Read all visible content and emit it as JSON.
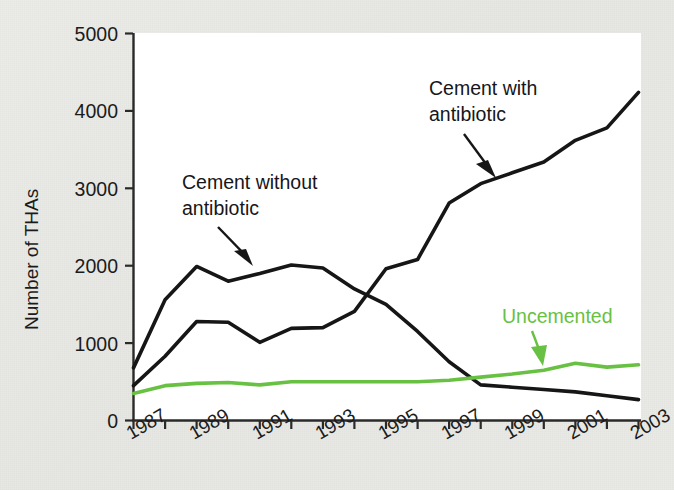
{
  "chart_data": {
    "type": "line",
    "title": "",
    "subtitle": "",
    "xlabel": "",
    "ylabel": "Number of THAs",
    "xlim": [
      1987,
      2003
    ],
    "ylim": [
      0,
      5000
    ],
    "grid": false,
    "legend_position": "inline-annotations",
    "x": [
      1987,
      1988,
      1989,
      1990,
      1991,
      1992,
      1993,
      1994,
      1995,
      1996,
      1997,
      1998,
      1999,
      2000,
      2001,
      2002,
      2003
    ],
    "y_ticks": [
      0,
      1000,
      2000,
      3000,
      4000,
      5000
    ],
    "y_tick_labels": [
      "0",
      "1000",
      "2000",
      "3000",
      "4000",
      "5000"
    ],
    "x_tick_labels": [
      "1987",
      "",
      "1989",
      "",
      "1991",
      "",
      "1993",
      "",
      "1995",
      "",
      "1997",
      "",
      "1999",
      "",
      "2001",
      "",
      "2003"
    ],
    "x_tick_labels_shown": [
      "1987",
      "1989",
      "1991",
      "1993",
      "1995",
      "1997",
      "1999",
      "2001",
      "2003"
    ],
    "series": [
      {
        "name": "Cement without antibiotic",
        "color": "#161616",
        "values": [
          680,
          1560,
          1990,
          1800,
          1900,
          2010,
          1970,
          1700,
          1500,
          1150,
          760,
          460,
          430,
          400,
          370,
          320,
          270
        ]
      },
      {
        "name": "Cement with antibiotic",
        "color": "#161616",
        "values": [
          450,
          830,
          1280,
          1270,
          1010,
          1190,
          1200,
          1410,
          1960,
          2080,
          2810,
          3060,
          3200,
          3340,
          3620,
          3780,
          4240
        ]
      },
      {
        "name": "Uncemented",
        "color": "#68c143",
        "values": [
          350,
          450,
          480,
          490,
          460,
          500,
          500,
          500,
          500,
          500,
          520,
          560,
          600,
          650,
          740,
          690,
          720
        ]
      }
    ],
    "annotations": [
      {
        "name": "cement-without-antibiotic",
        "text_line1": "Cement without",
        "text_line2": "antibiotic",
        "color": "#16161a"
      },
      {
        "name": "cement-with-antibiotic",
        "text_line1": "Cement with",
        "text_line2": "antibiotic",
        "color": "#16161a"
      },
      {
        "name": "uncemented",
        "text_line1": "Uncemented",
        "text_line2": "",
        "color": "#68c143"
      }
    ],
    "colors": {
      "black_series": "#161616",
      "green_series": "#68c143",
      "plot_background": "#ffffff",
      "figure_background": "#e9eae6",
      "axis": "#2a2a2a"
    }
  }
}
